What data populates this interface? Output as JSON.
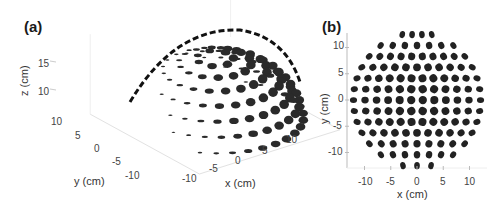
{
  "panels": {
    "a": {
      "label": "(a)",
      "zlabel": "z (cm)",
      "xlabel": "x (cm)",
      "ylabel": "y (cm)",
      "zticks": [
        "15",
        "10"
      ],
      "yticks": [
        "10",
        "5",
        "0",
        "-5",
        "-10"
      ],
      "xticks": [
        "-10",
        "-5",
        "0",
        "5",
        "10"
      ]
    },
    "b": {
      "label": "(b)",
      "xlabel": "x (cm)",
      "ylabel": "y (cm)",
      "yticks": [
        "10",
        "5",
        "0",
        "-5",
        "-10"
      ],
      "xticks": [
        "-10",
        "-5",
        "0",
        "5",
        "10"
      ]
    }
  },
  "chart_data": [
    {
      "type": "scatter",
      "title": "(a)",
      "subtitle": "3D view of circular elements arranged on a hemispherical dome",
      "xlabel": "x (cm)",
      "ylabel": "y (cm)",
      "zlabel": "z (cm)",
      "xlim": [
        -13,
        13
      ],
      "ylim": [
        -13,
        13
      ],
      "zlim": [
        0,
        15
      ],
      "xticks": [
        -10,
        -5,
        0,
        5,
        10
      ],
      "yticks": [
        -10,
        -5,
        0,
        5,
        10
      ],
      "zticks": [
        10,
        15
      ],
      "grid": true,
      "shape": "hemisphere",
      "radius_cm": 13,
      "element_marker": "filled dark disk"
    },
    {
      "type": "scatter",
      "title": "(b)",
      "subtitle": "Top (x-y) projection of the dome elements",
      "xlabel": "x (cm)",
      "ylabel": "y (cm)",
      "xlim": [
        -13,
        13
      ],
      "ylim": [
        -13,
        13
      ],
      "xticks": [
        -10,
        -5,
        0,
        5,
        10
      ],
      "yticks": [
        -10,
        -5,
        0,
        5,
        10
      ],
      "grid": false,
      "shape": "disk",
      "radius_cm": 13,
      "rows_y": [
        12.5,
        10.5,
        8.5,
        6,
        3.5,
        1.5,
        0,
        -1.5,
        -3.5,
        -6,
        -8.5,
        -10.5,
        -12.5
      ],
      "element_marker": "filled dark ellipse"
    }
  ]
}
